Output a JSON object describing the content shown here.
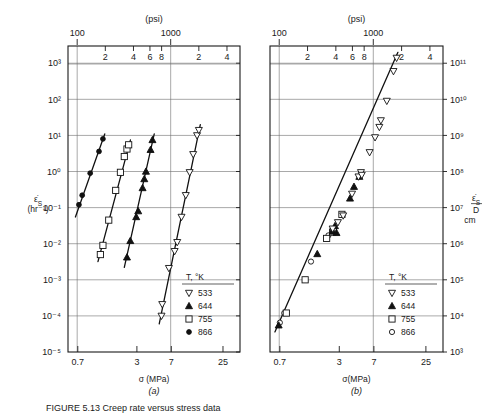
{
  "figure": {
    "caption_prefix": "FIGURE 5.13",
    "caption_text": "Creep rate versus stress data",
    "top_axis_label": "(psi)"
  },
  "chart_data": [
    {
      "id": "panel-a",
      "type": "scatter",
      "panel_letter": "(a)",
      "title": "",
      "xlabel": "σ (MPa)",
      "ylabel": "ε̇S (hr⁻¹)",
      "top_axis_label": "(psi)",
      "xscale": "log",
      "yscale": "log",
      "xlim": [
        0.55,
        38
      ],
      "ylim": [
        1e-05,
        3000
      ],
      "x_tick_labels": [
        "0.7",
        "3",
        "7",
        "25"
      ],
      "x_tick_values": [
        0.7,
        3,
        7,
        25
      ],
      "y_tick_labels": [
        "10³",
        "10²",
        "10¹",
        "10⁰",
        "10⁻¹",
        "10⁻²",
        "10⁻³",
        "10⁻⁴",
        "10⁻⁵"
      ],
      "y_tick_values": [
        1000,
        100,
        10,
        1,
        0.1,
        0.01,
        0.001,
        0.0001,
        1e-05
      ],
      "top_tick_labels": [
        "100",
        "2",
        "4",
        "6",
        "8",
        "1000",
        "2",
        "4",
        "6"
      ],
      "top_tick_values_psi": [
        100,
        200,
        400,
        600,
        800,
        1000,
        2000,
        4000,
        6000
      ],
      "grid": true,
      "legend_position": "lower-right",
      "legend_title": "T, °K",
      "series": [
        {
          "name": "866",
          "marker": "circle-filled",
          "points": [
            {
              "x": 0.72,
              "y": 0.12
            },
            {
              "x": 0.78,
              "y": 0.22
            },
            {
              "x": 0.95,
              "y": 0.9
            },
            {
              "x": 1.18,
              "y": 3.6
            },
            {
              "x": 1.3,
              "y": 8.0
            }
          ]
        },
        {
          "name": "755",
          "marker": "square-open",
          "points": [
            {
              "x": 1.22,
              "y": 0.005
            },
            {
              "x": 1.3,
              "y": 0.009
            },
            {
              "x": 1.5,
              "y": 0.045
            },
            {
              "x": 1.78,
              "y": 0.3
            },
            {
              "x": 2.0,
              "y": 0.95
            },
            {
              "x": 2.2,
              "y": 2.6
            },
            {
              "x": 2.35,
              "y": 4.2
            },
            {
              "x": 2.45,
              "y": 5.5
            }
          ]
        },
        {
          "name": "644",
          "marker": "triangle-up-filled",
          "points": [
            {
              "x": 2.35,
              "y": 0.0042
            },
            {
              "x": 2.55,
              "y": 0.012
            },
            {
              "x": 2.95,
              "y": 0.055
            },
            {
              "x": 3.1,
              "y": 0.08
            },
            {
              "x": 3.45,
              "y": 0.35
            },
            {
              "x": 3.6,
              "y": 0.62
            },
            {
              "x": 3.75,
              "y": 1.0
            },
            {
              "x": 4.2,
              "y": 4.0
            },
            {
              "x": 4.4,
              "y": 7.5
            }
          ]
        },
        {
          "name": "533",
          "marker": "triangle-down-open",
          "points": [
            {
              "x": 5.5,
              "y": 0.0001
            },
            {
              "x": 5.6,
              "y": 0.00021
            },
            {
              "x": 6.6,
              "y": 0.0021
            },
            {
              "x": 7.6,
              "y": 0.0062
            },
            {
              "x": 8.1,
              "y": 0.011
            },
            {
              "x": 9.0,
              "y": 0.055
            },
            {
              "x": 10.0,
              "y": 0.22
            },
            {
              "x": 11.0,
              "y": 0.95
            },
            {
              "x": 12.0,
              "y": 3.0
            },
            {
              "x": 13.2,
              "y": 10.0
            },
            {
              "x": 13.8,
              "y": 14.0
            }
          ]
        }
      ],
      "fit_lines": [
        {
          "series": "866",
          "x1": 0.66,
          "y1": 0.055,
          "x2": 1.36,
          "y2": 11.0
        },
        {
          "series": "755",
          "x1": 1.15,
          "y1": 0.0032,
          "x2": 2.56,
          "y2": 7.5
        },
        {
          "series": "644",
          "x1": 2.2,
          "y1": 0.0022,
          "x2": 4.6,
          "y2": 11.0
        },
        {
          "series": "533",
          "x1": 5.2,
          "y1": 6e-05,
          "x2": 14.3,
          "y2": 20.0
        }
      ]
    },
    {
      "id": "panel-b",
      "type": "scatter",
      "panel_letter": "(b)",
      "title": "",
      "xlabel": "σ(MPa)",
      "ylabel": "ε̇S / D   cm",
      "top_axis_label": "(psi)",
      "xscale": "log",
      "yscale": "log",
      "xlim": [
        0.55,
        38
      ],
      "ylim": [
        1000,
        300000000000.0
      ],
      "x_tick_labels": [
        "0.7",
        "3",
        "7",
        "25"
      ],
      "x_tick_values": [
        0.7,
        3,
        7,
        25
      ],
      "y_tick_labels": [
        "10¹¹",
        "10¹⁰",
        "10⁹",
        "10⁸",
        "10⁷",
        "10⁶",
        "10⁵",
        "10⁴",
        "10³"
      ],
      "y_tick_values": [
        100000000000.0,
        10000000000.0,
        1000000000.0,
        100000000.0,
        10000000.0,
        1000000.0,
        100000.0,
        10000.0,
        1000.0
      ],
      "top_tick_labels": [
        "100",
        "2",
        "4",
        "6",
        "8",
        "1000",
        "2",
        "4",
        "6"
      ],
      "top_tick_values_psi": [
        100,
        200,
        400,
        600,
        800,
        1000,
        2000,
        4000,
        6000
      ],
      "grid": true,
      "legend_position": "lower-right",
      "legend_title": "T, °K",
      "series": [
        {
          "name": "866",
          "marker": "circle-open",
          "points": [
            {
              "x": 0.7,
              "y": 6500
            },
            {
              "x": 0.78,
              "y": 12000
            },
            {
              "x": 1.5,
              "y": 320000
            },
            {
              "x": 2.3,
              "y": 1700000
            }
          ]
        },
        {
          "name": "755",
          "marker": "square-open",
          "points": [
            {
              "x": 0.82,
              "y": 12000
            },
            {
              "x": 1.3,
              "y": 100000
            },
            {
              "x": 2.2,
              "y": 1400000
            },
            {
              "x": 2.55,
              "y": 2100000
            },
            {
              "x": 2.6,
              "y": 2300000
            },
            {
              "x": 3.2,
              "y": 6500000
            }
          ]
        },
        {
          "name": "644",
          "marker": "triangle-up-filled",
          "points": [
            {
              "x": 0.68,
              "y": 5500
            },
            {
              "x": 1.75,
              "y": 520000
            },
            {
              "x": 2.55,
              "y": 2200000
            },
            {
              "x": 2.7,
              "y": 3100000
            },
            {
              "x": 2.8,
              "y": 2000000
            },
            {
              "x": 3.9,
              "y": 18000000
            },
            {
              "x": 4.3,
              "y": 38000000
            },
            {
              "x": 4.9,
              "y": 72000000
            }
          ]
        },
        {
          "name": "533",
          "marker": "triangle-down-open",
          "points": [
            {
              "x": 2.55,
              "y": 2600000
            },
            {
              "x": 2.9,
              "y": 3900000
            },
            {
              "x": 3.3,
              "y": 6000000
            },
            {
              "x": 4.1,
              "y": 24000000
            },
            {
              "x": 4.8,
              "y": 72000000
            },
            {
              "x": 5.1,
              "y": 95000000
            },
            {
              "x": 5.2,
              "y": 80000000
            },
            {
              "x": 6.3,
              "y": 340000000
            },
            {
              "x": 7.2,
              "y": 880000000
            },
            {
              "x": 8.0,
              "y": 1700000000
            },
            {
              "x": 8.3,
              "y": 2600000000
            },
            {
              "x": 9.6,
              "y": 9000000000
            },
            {
              "x": 11.3,
              "y": 60000000000
            },
            {
              "x": 12.2,
              "y": 140000000000
            }
          ]
        }
      ],
      "fit_lines": [
        {
          "series": "all",
          "x1": 0.62,
          "y1": 3600,
          "x2": 12.6,
          "y2": 200000000000.0
        }
      ]
    }
  ],
  "legend": {
    "title": "T, °K",
    "entries_a": [
      {
        "label": "533",
        "marker": "triangle-down-open"
      },
      {
        "label": "644",
        "marker": "triangle-up-filled"
      },
      {
        "label": "755",
        "marker": "square-open"
      },
      {
        "label": "866",
        "marker": "circle-filled"
      }
    ],
    "entries_b": [
      {
        "label": "533",
        "marker": "triangle-down-open"
      },
      {
        "label": "644",
        "marker": "triangle-up-filled"
      },
      {
        "label": "755",
        "marker": "square-open"
      },
      {
        "label": "866",
        "marker": "circle-open"
      }
    ]
  },
  "colors": {
    "ink": "#1a1a1a",
    "grid": "#6e6e6e",
    "paper": "#ffffff"
  }
}
